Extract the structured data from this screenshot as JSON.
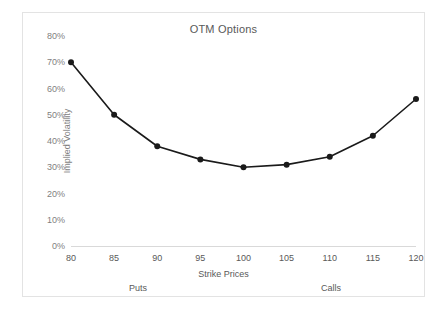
{
  "chart_data": {
    "type": "line",
    "title": "OTM Options",
    "xlabel": "Strike Prices",
    "ylabel": "Implied Volatility",
    "x": [
      80,
      85,
      90,
      95,
      100,
      105,
      110,
      115,
      120
    ],
    "categories": [
      "80",
      "85",
      "90",
      "95",
      "100",
      "105",
      "110",
      "115",
      "120"
    ],
    "values": [
      70,
      50,
      38,
      33,
      30,
      31,
      34,
      42,
      56
    ],
    "series": [
      {
        "name": "Implied Volatility",
        "values": [
          70,
          50,
          38,
          33,
          30,
          31,
          34,
          42,
          56
        ]
      }
    ],
    "ylim": [
      0,
      80
    ],
    "ytick_values": [
      0,
      10,
      20,
      30,
      40,
      50,
      60,
      70,
      80
    ],
    "ytick_labels": [
      "0%",
      "10%",
      "20%",
      "30%",
      "40%",
      "50%",
      "60%",
      "70%",
      "80%"
    ],
    "grid": false,
    "legend": "none",
    "line_color": "#1a1a1a",
    "marker_color": "#1a1a1a",
    "marker": "circle",
    "annotations": [
      {
        "text": "Puts",
        "position": "below-axis-left"
      },
      {
        "text": "Calls",
        "position": "below-axis-right"
      }
    ]
  },
  "axis_region_labels": {
    "puts": "Puts",
    "calls": "Calls"
  },
  "colors": {
    "title_text": "#595959",
    "tick_text": "#7f7f7f",
    "axis_line": "#d9d9d9",
    "frame_border": "#e3e3e3",
    "series": "#1a1a1a"
  }
}
